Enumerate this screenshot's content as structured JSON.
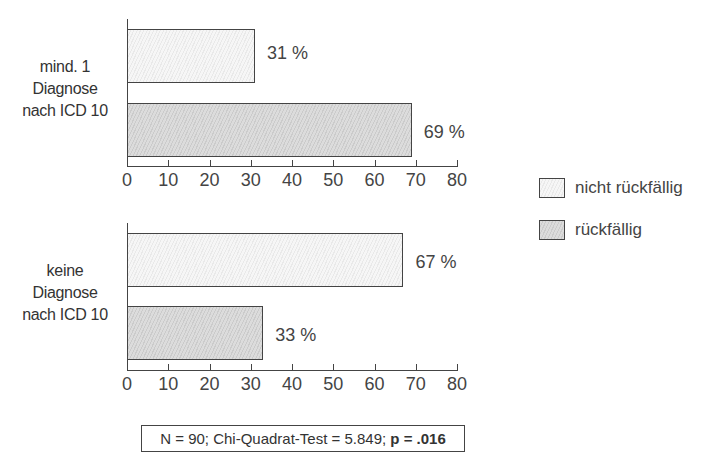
{
  "chart_data": {
    "type": "bar",
    "orientation": "horizontal",
    "panels": [
      {
        "label": "mind. 1 Diagnose nach ICD 10",
        "label_lines": [
          "mind. 1",
          "Diagnose",
          "nach ICD 10"
        ],
        "series": [
          {
            "name": "nicht rückfällig",
            "value": 31,
            "value_label": "31 %"
          },
          {
            "name": "rückfällig",
            "value": 69,
            "value_label": "69 %"
          }
        ]
      },
      {
        "label": "keine Diagnose nach ICD 10",
        "label_lines": [
          "keine",
          "Diagnose",
          "nach ICD 10"
        ],
        "series": [
          {
            "name": "nicht rückfällig",
            "value": 67,
            "value_label": "67 %"
          },
          {
            "name": "rückfällig",
            "value": 33,
            "value_label": "33 %"
          }
        ]
      }
    ],
    "xlim": [
      0,
      80
    ],
    "xticks": [
      "0",
      "10",
      "20",
      "30",
      "40",
      "50",
      "60",
      "70",
      "80"
    ],
    "legend": [
      {
        "label": "nicht rückfällig",
        "style": "light-hatched"
      },
      {
        "label": "rückfällig",
        "style": "gray-hatched"
      }
    ],
    "legend_position": "right",
    "grid": false,
    "footnote": {
      "text_main": "N = 90; Chi-Quadrat-Test = 5.849; ",
      "text_bold": "p = .016"
    },
    "colors": {
      "nicht_rueckfaellig": "#f2f2f2",
      "rueckfaellig": "#d6d6d6",
      "axis": "#444444"
    }
  }
}
